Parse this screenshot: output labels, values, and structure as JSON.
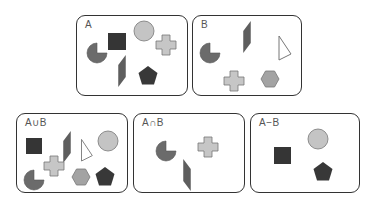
{
  "colors": {
    "square": "#353535",
    "circle": "#c4c4c4",
    "cross": "#c6c6c6",
    "pacman": "#6b6b6b",
    "parallelogram": "#5e5e5e",
    "pentagon": "#383838",
    "hexagon": "#a3a3a3",
    "triangle": "#ffffff",
    "stroke": "#777777"
  },
  "sets": [
    {
      "id": "A",
      "label": "A",
      "members": [
        "pacman",
        "square",
        "circle",
        "cross",
        "parallelogram",
        "pentagon"
      ]
    },
    {
      "id": "B",
      "label": "B",
      "members": [
        "pacman",
        "parallelogram",
        "triangle",
        "cross",
        "hexagon"
      ]
    },
    {
      "id": "union",
      "label": "A∪B",
      "members": [
        "square",
        "parallelogram",
        "triangle",
        "circle",
        "cross",
        "pacman",
        "hexagon",
        "pentagon"
      ]
    },
    {
      "id": "intersection",
      "label": "A∩B",
      "members": [
        "pacman",
        "cross",
        "parallelogram"
      ]
    },
    {
      "id": "difference",
      "label": "A−B",
      "members": [
        "circle",
        "square",
        "pentagon"
      ]
    }
  ]
}
